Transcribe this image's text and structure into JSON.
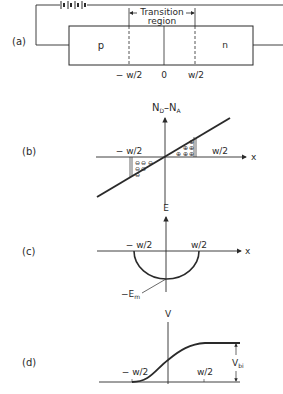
{
  "figure": {
    "panel_a": {
      "label": "(a)",
      "region_p": "p",
      "region_n": "n",
      "transition_line1": "Transition",
      "transition_line2": "region",
      "tick_neg": "− w/2",
      "tick_zero": "0",
      "tick_pos": "w/2"
    },
    "panel_b": {
      "label": "(b)",
      "y_axis_main": "N",
      "y_axis_sub1": "D",
      "y_axis_mid": "–N",
      "y_axis_sub2": "A",
      "x_axis": "x",
      "tick_neg": "− w/2",
      "tick_pos": "w/2",
      "neg_charge_symbol": "⊖",
      "pos_charge_symbol": "⊕"
    },
    "panel_c": {
      "label": "(c)",
      "y_axis": "E",
      "x_axis": "x",
      "tick_neg": "− w/2",
      "tick_pos": "w/2",
      "peak_main": "−E",
      "peak_sub": "m"
    },
    "panel_d": {
      "label": "(d)",
      "y_axis": "V",
      "tick_neg": "− w/2",
      "tick_pos": "w/2",
      "vbi_main": "V",
      "vbi_sub": "bi"
    }
  }
}
